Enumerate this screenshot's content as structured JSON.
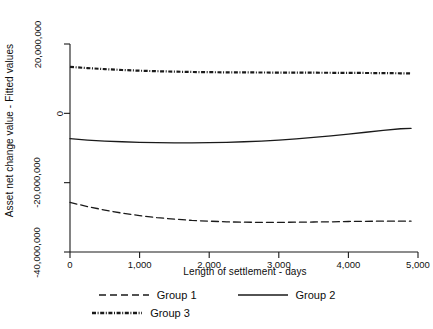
{
  "chart_data": {
    "type": "line",
    "title": "",
    "xlabel": "Length of settlement - days",
    "ylabel": "Asset  net change value - Fitted values",
    "xlim": [
      0,
      5000
    ],
    "ylim": [
      -40000000,
      20000000
    ],
    "grid": false,
    "legend_position": "bottom",
    "xticks": [
      0,
      1000,
      2000,
      3000,
      4000,
      5000
    ],
    "xtick_labels": [
      "0",
      "1,000",
      "2,000",
      "3,000",
      "4,000",
      "5,000"
    ],
    "yticks": [
      20000000,
      0,
      -20000000,
      -40000000
    ],
    "ytick_labels": [
      "20,000,000",
      "0",
      "-20,000,000",
      "-40,000,000"
    ],
    "x": [
      0,
      250,
      500,
      750,
      1000,
      1250,
      1500,
      1750,
      2000,
      2250,
      2500,
      2750,
      3000,
      3250,
      3500,
      3750,
      4000,
      4250,
      4500,
      4750,
      4900
    ],
    "series": [
      {
        "name": "Group 1",
        "style": "dashed",
        "color": "#1a1a1a",
        "values": [
          -25700000,
          -26900000,
          -27900000,
          -28800000,
          -29500000,
          -30100000,
          -30500000,
          -30900000,
          -31100000,
          -31300000,
          -31400000,
          -31450000,
          -31450000,
          -31400000,
          -31350000,
          -31300000,
          -31200000,
          -31150000,
          -31100000,
          -31100000,
          -31100000
        ]
      },
      {
        "name": "Group 2",
        "style": "solid",
        "color": "#1a1a1a",
        "values": [
          -7300000,
          -7700000,
          -8000000,
          -8200000,
          -8350000,
          -8450000,
          -8500000,
          -8500000,
          -8450000,
          -8350000,
          -8200000,
          -8000000,
          -7700000,
          -7350000,
          -6950000,
          -6500000,
          -6000000,
          -5450000,
          -4900000,
          -4450000,
          -4350000
        ]
      },
      {
        "name": "Group 3",
        "style": "dashdot",
        "color": "#1a1a1a",
        "values": [
          13400000,
          13050000,
          12750000,
          12500000,
          12300000,
          12150000,
          12020000,
          11930000,
          11870000,
          11830000,
          11800000,
          11780000,
          11760000,
          11740000,
          11720000,
          11700000,
          11670000,
          11640000,
          11600000,
          11550000,
          11500000
        ]
      }
    ]
  },
  "legend": {
    "entries": [
      {
        "label": "Group 1",
        "style": "dashed"
      },
      {
        "label": "Group 2",
        "style": "solid"
      },
      {
        "label": "Group 3",
        "style": "dashdot"
      }
    ]
  }
}
